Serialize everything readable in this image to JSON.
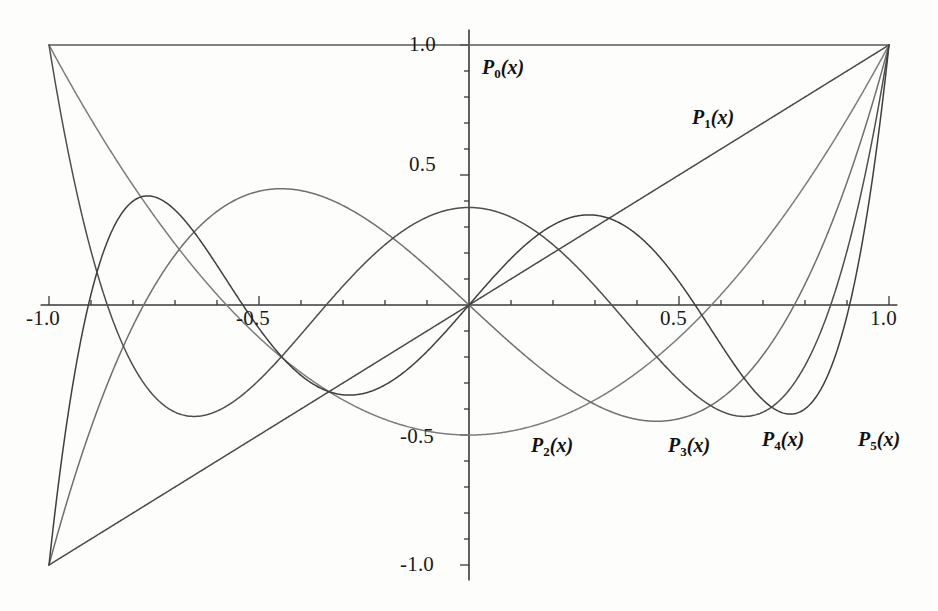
{
  "chart_data": {
    "type": "line",
    "title": "",
    "xlabel": "",
    "ylabel": "",
    "xlim": [
      -1.0,
      1.0
    ],
    "ylim": [
      -1.0,
      1.0
    ],
    "grid": false,
    "legend_position": "inline-annotations",
    "x_ticks_major": [
      "-1.0",
      "-0.5",
      "0.5",
      "1.0"
    ],
    "x_tick_values": [
      -1.0,
      -0.5,
      0.5,
      1.0
    ],
    "x_ticks_minor_step": 0.1,
    "y_ticks_major": [
      "1.0",
      "0.5",
      "-0.5",
      "-1.0"
    ],
    "y_tick_values": [
      1.0,
      0.5,
      -0.5,
      -1.0
    ],
    "y_ticks_minor_step": 0.1,
    "axis_color": "#3a3a3a",
    "background": "#fdfdfc",
    "series": [
      {
        "name": "P_0(x)",
        "label": "P",
        "subscript": "0",
        "arg": "(x)",
        "color": "#5a5a5a",
        "degree": 0,
        "coeffs": [
          1
        ],
        "endpoints": {
          "at_minus_1": 1.0,
          "at_plus_1": 1.0
        },
        "label_xy": [
          0.03,
          0.86
        ]
      },
      {
        "name": "P_1(x)",
        "label": "P",
        "subscript": "1",
        "arg": "(x)",
        "color": "#4a4a4a",
        "degree": 1,
        "coeffs": [
          0,
          1
        ],
        "endpoints": {
          "at_minus_1": -1.0,
          "at_plus_1": 1.0
        },
        "label_xy": [
          0.54,
          0.8
        ]
      },
      {
        "name": "P_2(x)",
        "label": "P",
        "subscript": "2",
        "arg": "(x)",
        "color": "#7d7d7d",
        "degree": 2,
        "coeffs": [
          -0.5,
          0,
          1.5
        ],
        "endpoints": {
          "at_minus_1": 1.0,
          "at_plus_1": 1.0
        },
        "extrema": [
          {
            "x": 0.0,
            "y": -0.5
          }
        ],
        "label_xy": [
          0.16,
          -1.025
        ]
      },
      {
        "name": "P_3(x)",
        "label": "P",
        "subscript": "3",
        "arg": "(x)",
        "color": "#707070",
        "degree": 3,
        "coeffs": [
          0,
          -1.5,
          0,
          2.5
        ],
        "endpoints": {
          "at_minus_1": -1.0,
          "at_plus_1": 1.0
        },
        "extrema": [
          {
            "x": -0.4472,
            "y": 0.3849
          },
          {
            "x": 0.4472,
            "y": -0.3849
          }
        ],
        "label_xy": [
          0.49,
          -1.025
        ]
      },
      {
        "name": "P_4(x)",
        "label": "P",
        "subscript": "4",
        "arg": "(x)",
        "color": "#4f4f4f",
        "degree": 4,
        "coeffs": [
          0.375,
          0,
          -3.75,
          0,
          4.375
        ],
        "endpoints": {
          "at_minus_1": 1.0,
          "at_plus_1": 1.0
        },
        "extrema": [
          {
            "x": -0.6547,
            "y": -0.4286
          },
          {
            "x": 0.0,
            "y": 0.375
          },
          {
            "x": 0.6547,
            "y": -0.4286
          }
        ],
        "label_xy": [
          0.715,
          -1.0
        ]
      },
      {
        "name": "P_5(x)",
        "label": "P",
        "subscript": "5",
        "arg": "(x)",
        "color": "#3f3f3f",
        "degree": 5,
        "coeffs": [
          0,
          1.875,
          0,
          -8.75,
          0,
          7.875
        ],
        "endpoints": {
          "at_minus_1": -1.0,
          "at_plus_1": 1.0
        },
        "extrema": [
          {
            "x": -0.7651,
            "y": 0.4196
          },
          {
            "x": -0.2852,
            "y": -0.3466
          },
          {
            "x": 0.2852,
            "y": 0.3466
          },
          {
            "x": 0.7651,
            "y": -0.4196
          }
        ],
        "label_xy": [
          0.925,
          -1.0
        ]
      }
    ]
  },
  "labels": {
    "x_axis": [
      {
        "text": "-1.0",
        "value": -1.0
      },
      {
        "text": "-0.5",
        "value": -0.5
      },
      {
        "text": "0.5",
        "value": 0.5
      },
      {
        "text": "1.0",
        "value": 1.0
      }
    ],
    "y_axis": [
      {
        "text": "1.0",
        "value": 1.0
      },
      {
        "text": "0.5",
        "value": 0.5
      },
      {
        "text": "-0.5",
        "value": -0.5
      },
      {
        "text": "-1.0",
        "value": -1.0
      }
    ]
  },
  "curve_labels": {
    "p0": {
      "base": "P",
      "sub": "0",
      "arg": "(x)"
    },
    "p1": {
      "base": "P",
      "sub": "1",
      "arg": "(x)"
    },
    "p2": {
      "base": "P",
      "sub": "2",
      "arg": "(x)"
    },
    "p3": {
      "base": "P",
      "sub": "3",
      "arg": "(x)"
    },
    "p4": {
      "base": "P",
      "sub": "4",
      "arg": "(x)"
    },
    "p5": {
      "base": "P",
      "sub": "5",
      "arg": "(x)"
    }
  }
}
